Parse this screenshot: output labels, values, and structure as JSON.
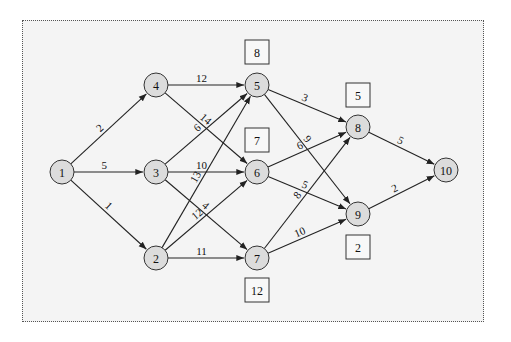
{
  "diagram": {
    "type": "directed-network",
    "nodes": [
      {
        "id": "1",
        "label": "1",
        "x": 62,
        "y": 172
      },
      {
        "id": "2",
        "label": "2",
        "x": 156,
        "y": 258
      },
      {
        "id": "3",
        "label": "3",
        "x": 156,
        "y": 172
      },
      {
        "id": "4",
        "label": "4",
        "x": 156,
        "y": 85
      },
      {
        "id": "5",
        "label": "5",
        "x": 257,
        "y": 85
      },
      {
        "id": "6",
        "label": "6",
        "x": 257,
        "y": 172
      },
      {
        "id": "7",
        "label": "7",
        "x": 257,
        "y": 258
      },
      {
        "id": "8",
        "label": "8",
        "x": 358,
        "y": 127
      },
      {
        "id": "9",
        "label": "9",
        "x": 358,
        "y": 214
      },
      {
        "id": "10",
        "label": "10",
        "x": 446,
        "y": 170
      }
    ],
    "edges": [
      {
        "from": "1",
        "to": "4",
        "weight": "2"
      },
      {
        "from": "1",
        "to": "3",
        "weight": "5"
      },
      {
        "from": "1",
        "to": "2",
        "weight": "1"
      },
      {
        "from": "4",
        "to": "5",
        "weight": "12"
      },
      {
        "from": "4",
        "to": "6",
        "weight": "14"
      },
      {
        "from": "3",
        "to": "5",
        "weight": "6"
      },
      {
        "from": "3",
        "to": "6",
        "weight": "10"
      },
      {
        "from": "3",
        "to": "7",
        "weight": "4"
      },
      {
        "from": "2",
        "to": "5",
        "weight": "13"
      },
      {
        "from": "2",
        "to": "6",
        "weight": "12"
      },
      {
        "from": "2",
        "to": "7",
        "weight": "11"
      },
      {
        "from": "5",
        "to": "8",
        "weight": "3"
      },
      {
        "from": "5",
        "to": "9",
        "weight": "9"
      },
      {
        "from": "6",
        "to": "8",
        "weight": "6"
      },
      {
        "from": "6",
        "to": "9",
        "weight": "5"
      },
      {
        "from": "7",
        "to": "8",
        "weight": "8"
      },
      {
        "from": "7",
        "to": "9",
        "weight": "10"
      },
      {
        "from": "8",
        "to": "10",
        "weight": "5"
      },
      {
        "from": "9",
        "to": "10",
        "weight": "2"
      }
    ],
    "boxes": [
      {
        "for_node": "5",
        "value": "8",
        "x": 245,
        "y": 40
      },
      {
        "for_node": "6",
        "value": "7",
        "x": 245,
        "y": 128
      },
      {
        "for_node": "7",
        "value": "12",
        "x": 245,
        "y": 278
      },
      {
        "for_node": "8",
        "value": "5",
        "x": 346,
        "y": 83
      },
      {
        "for_node": "9",
        "value": "2",
        "x": 346,
        "y": 235
      }
    ]
  }
}
